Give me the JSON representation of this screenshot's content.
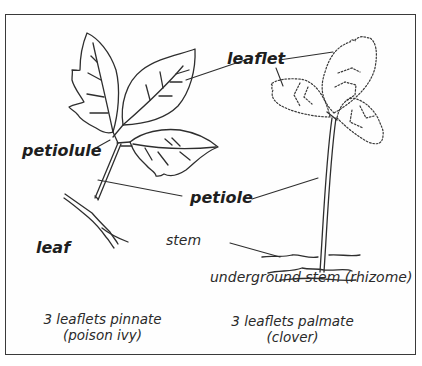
{
  "diagram": {
    "labels": {
      "leaflet": "leaflet",
      "petiolule": "petiolule",
      "petiole": "petiole",
      "leaf": "leaf",
      "stem": "stem",
      "rhizome": "underground stem (rhizome)"
    },
    "captions": {
      "pinnate": {
        "line1": "3 leaflets pinnate",
        "line2": "(poison ivy)"
      },
      "palmate": {
        "line1": "3 leaflets palmate",
        "line2": "(clover)"
      }
    },
    "colors": {
      "ink": "#2a2a2a",
      "frame": "#3a3a3a",
      "background": "#ffffff"
    }
  }
}
